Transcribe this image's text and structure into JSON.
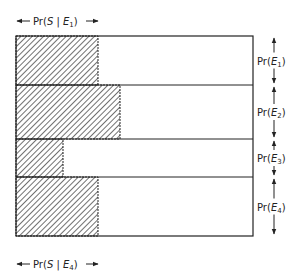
{
  "diagram": {
    "top_label": "Pr(S | E1)",
    "bottom_label": "Pr(S | E4)",
    "rows": [
      {
        "label": "Pr(E1)",
        "sub": "1",
        "y0": 36,
        "y1": 85,
        "hatch_x": 98
      },
      {
        "label": "Pr(E2)",
        "sub": "2",
        "y0": 85,
        "y1": 139,
        "hatch_x": 120
      },
      {
        "label": "Pr(E3)",
        "sub": "3",
        "y0": 139,
        "y1": 177,
        "hatch_x": 63
      },
      {
        "label": "Pr(E4)",
        "sub": "4",
        "y0": 177,
        "y1": 236,
        "hatch_x": 98
      }
    ],
    "box": {
      "x0": 16,
      "x1": 253
    },
    "colors": {
      "line": "#222222",
      "hatch": "#333333",
      "background": "#ffffff"
    }
  }
}
